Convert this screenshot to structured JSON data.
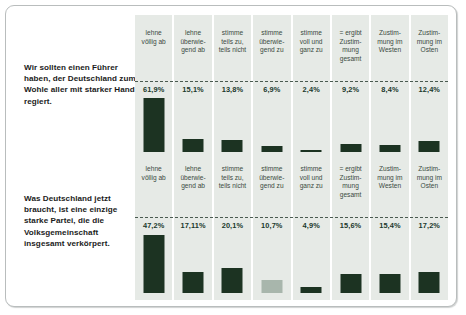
{
  "figure": {
    "accent_color": "#1c3322",
    "panel_bg": "#e6eae6",
    "border_color": "#b9bdbd"
  },
  "columns": [
    "lehne\nvöllig ab",
    "lehne\nüberwie-\ngend ab",
    "stimme\nteils zu,\nteils nicht",
    "stimme\nüberwie-\ngend zu",
    "stimme\nvoll und\nganz zu",
    "= ergibt\nZustim-\nmung\ngesamt",
    "Zustim-\nmung im\nWesten",
    "Zustim-\nmung im\nOsten"
  ],
  "panels": [
    {
      "statement": "Wir sollten einen Führer haben, der Deutschland zum Wohle aller mit starker Hand regiert.",
      "values": [
        "61,9%",
        "15,1%",
        "13,8%",
        "6,9%",
        "2,4%",
        "9,2%",
        "8,4%",
        "12,4%"
      ]
    },
    {
      "statement": "Was Deutschland jetzt braucht, ist eine einzige starke Partei, die die Volksgemeinschaft insgesamt verkörpert.",
      "values": [
        "47,2%",
        "17,11%",
        "20,1%",
        "10,7%",
        "4,9%",
        "15,6%",
        "15,4%",
        "17,2%"
      ]
    }
  ],
  "chart_data": [
    {
      "type": "bar",
      "title": "Wir sollten einen Führer haben, der Deutschland zum Wohle aller mit starker Hand regiert.",
      "categories": [
        "lehne völlig ab",
        "lehne überwiegend ab",
        "stimme teils zu, teils nicht",
        "stimme überwiegend zu",
        "stimme voll und ganz zu",
        "= ergibt Zustimmung gesamt",
        "Zustimmung im Westen",
        "Zustimmung im Osten"
      ],
      "values": [
        61.9,
        15.1,
        13.8,
        6.9,
        2.4,
        9.2,
        8.4,
        12.4
      ],
      "value_labels": [
        "61,9%",
        "15,1%",
        "13,8%",
        "6,9%",
        "2,4%",
        "9,2%",
        "8,4%",
        "12,4%"
      ],
      "xlabel": "",
      "ylabel": "",
      "ylim": [
        0,
        65
      ],
      "grid": false,
      "legend": "none"
    },
    {
      "type": "bar",
      "title": "Was Deutschland jetzt braucht, ist eine einzige starke Partei, die die Volksgemeinschaft insgesamt verkörpert.",
      "categories": [
        "lehne völlig ab",
        "lehne überwiegend ab",
        "stimme teils zu, teils nicht",
        "stimme überwiegend zu",
        "stimme voll und ganz zu",
        "= ergibt Zustimmung gesamt",
        "Zustimmung im Westen",
        "Zustimmung im Osten"
      ],
      "values": [
        47.2,
        17.11,
        20.1,
        10.7,
        4.9,
        15.6,
        15.4,
        17.2
      ],
      "value_labels": [
        "47,2%",
        "17,11%",
        "20,1%",
        "10,7%",
        "4,9%",
        "15,6%",
        "15,4%",
        "17,2%"
      ],
      "xlabel": "",
      "ylabel": "",
      "ylim": [
        0,
        50
      ],
      "grid": false,
      "legend": "none"
    }
  ]
}
